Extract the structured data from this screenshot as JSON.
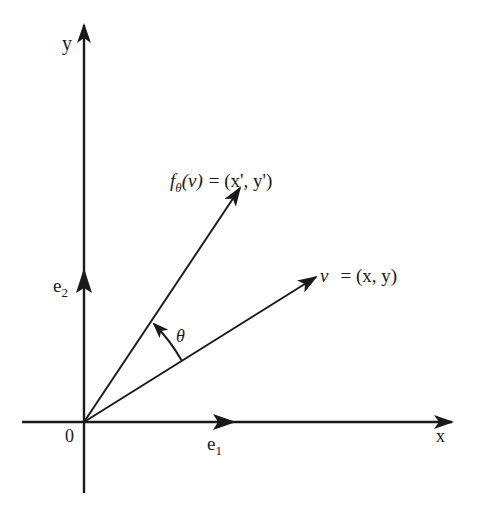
{
  "figure": {
    "axes": {
      "x_label": "x",
      "y_label": "y",
      "origin_label": "0"
    },
    "basis": {
      "e1_base": "e",
      "e1_sub": "1",
      "e2_base": "e",
      "e2_sub": "2"
    },
    "vectors": {
      "v_symbol": "v",
      "v_eq": "= (x, y)",
      "f_symbol": "f",
      "f_sub": "θ",
      "f_arg": "(v)",
      "f_eq": "= (x', y')"
    },
    "angle_label": "θ",
    "colors": {
      "ink": "#1a1a1a",
      "background": "#ffffff"
    }
  }
}
